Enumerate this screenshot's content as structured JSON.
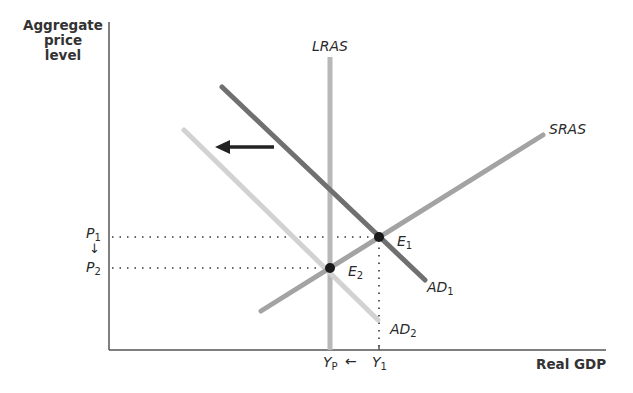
{
  "axes": {
    "y_label": "Aggregate price level",
    "y_label_lines": [
      "Aggregate",
      "price",
      "level"
    ],
    "x_label": "Real GDP"
  },
  "curves": {
    "lras": {
      "label": "LRAS",
      "color": "#b8b8b8"
    },
    "sras": {
      "label": "SRAS",
      "color": "#a3a3a3"
    },
    "ad1": {
      "label": "AD",
      "sub": "1",
      "color": "#707070"
    },
    "ad2": {
      "label": "AD",
      "sub": "2",
      "color": "#d2d2d2"
    }
  },
  "points": {
    "e1": {
      "label": "E",
      "sub": "1"
    },
    "e2": {
      "label": "E",
      "sub": "2"
    }
  },
  "ticks": {
    "p1": {
      "label": "P",
      "sub": "1"
    },
    "p2": {
      "label": "P",
      "sub": "2"
    },
    "yp": {
      "label": "Y",
      "sub": "P"
    },
    "y1": {
      "label": "Y",
      "sub": "1"
    }
  },
  "arrows": {
    "price_down": "↓",
    "output_left": "←"
  }
}
